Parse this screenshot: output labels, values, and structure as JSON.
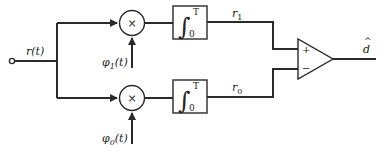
{
  "diagram": {
    "type": "correlation receiver block diagram",
    "input": {
      "label": "r(t)"
    },
    "branches": [
      {
        "id": "branch-1",
        "multiplier_symbol": "×",
        "reference_signal": "φ1(t)",
        "reference_base": "φ",
        "reference_sub": "1",
        "reference_arg": "(t)",
        "integrator": {
          "symbol": "∫",
          "upper_limit": "T",
          "lower_limit": "0"
        },
        "output": {
          "base": "r",
          "sub": "1"
        }
      },
      {
        "id": "branch-0",
        "multiplier_symbol": "×",
        "reference_signal": "φ0(t)",
        "reference_base": "φ",
        "reference_sub": "0",
        "reference_arg": "(t)",
        "integrator": {
          "symbol": "∫",
          "upper_limit": "T",
          "lower_limit": "0"
        },
        "output": {
          "base": "r",
          "sub": "0"
        }
      }
    ],
    "comparator": {
      "plus": "+",
      "minus": "−"
    },
    "output": {
      "label": "d",
      "hat": "^"
    },
    "colors": {
      "line": "#2a2a2a",
      "background": "#ffffff"
    }
  }
}
